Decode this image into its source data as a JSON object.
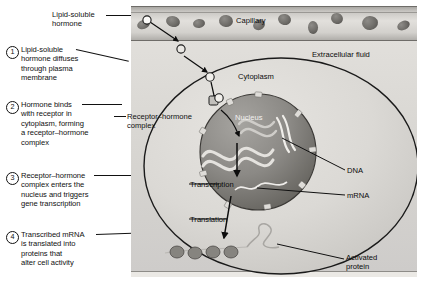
{
  "figure": {
    "background_color": "#ffffff",
    "panel_color": "#d8d6d2"
  },
  "callout_label": {
    "name": "lipid-soluble-hormone",
    "line1": "Lipid-soluble",
    "line2": "hormone"
  },
  "steps": [
    {
      "number": "1",
      "lines": [
        "Lipid-soluble",
        "hormone diffuses",
        "through plasma",
        "membrane"
      ]
    },
    {
      "number": "2",
      "lines": [
        "Hormone binds",
        "with receptor in",
        "cytoplasm, forming",
        "a receptor–hormone",
        "complex"
      ]
    },
    {
      "number": "3",
      "lines": [
        "Receptor–hormone",
        "complex enters the",
        "nucleus and triggers",
        "gene transcription"
      ]
    },
    {
      "number": "4",
      "lines": [
        "Transcribed mRNA",
        "is translated into",
        "proteins that",
        "alter cell activity"
      ]
    }
  ],
  "receptor_hormone_label": {
    "line1": "Receptor–hormone",
    "line2": "complex"
  },
  "diagram_labels": {
    "capillary": "Capillary",
    "extracellular_fluid": "Extracellular fluid",
    "cytoplasm": "Cytoplasm",
    "nucleus": "Nucleus",
    "dna": "DNA",
    "mrna": "mRNA",
    "transcription": "Transcription",
    "translation": "Translation",
    "activated_protein_line1": "Activated",
    "activated_protein_line2": "protein"
  },
  "colors": {
    "ink": "#111111",
    "capillary_band": "#d2d0cc",
    "red_blood_cell": "#6e6c68",
    "cytoplasm": "#d6d4d0",
    "nucleus": "#8e8c88",
    "hormone_dot": "#ffffff"
  }
}
